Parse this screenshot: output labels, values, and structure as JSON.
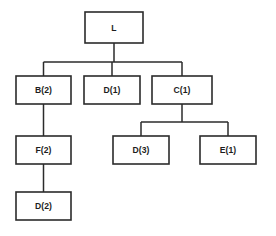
{
  "diagram": {
    "type": "tree",
    "title": "",
    "background_color": "#ffffff",
    "node_fill_color": "#ffffff",
    "node_border_color": "#2b2b2b",
    "edge_color": "#2b2b2b",
    "nodes": [
      {
        "id": "root",
        "label": "L",
        "x": 85,
        "y": 12,
        "w": 58,
        "h": 31,
        "cx": 114,
        "cy": 27.5,
        "level": 0
      },
      {
        "id": "b2",
        "label": "B(2)",
        "x": 16,
        "y": 76,
        "w": 55,
        "h": 28,
        "cx": 43.5,
        "cy": 90,
        "level": 1
      },
      {
        "id": "d1",
        "label": "D(1)",
        "x": 84,
        "y": 76,
        "w": 56,
        "h": 28,
        "cx": 112,
        "cy": 90,
        "level": 1
      },
      {
        "id": "c1",
        "label": "C(1)",
        "x": 152,
        "y": 76,
        "w": 60,
        "h": 28,
        "cx": 182,
        "cy": 90,
        "level": 1
      },
      {
        "id": "f2",
        "label": "F(2)",
        "x": 16,
        "y": 136,
        "w": 55,
        "h": 28,
        "cx": 43.5,
        "cy": 150,
        "level": 2
      },
      {
        "id": "d3",
        "label": "D(3)",
        "x": 113,
        "y": 136,
        "w": 56,
        "h": 28,
        "cx": 141,
        "cy": 150,
        "level": 2
      },
      {
        "id": "e1",
        "label": "E(1)",
        "x": 200,
        "y": 136,
        "w": 56,
        "h": 28,
        "cx": 228,
        "cy": 150,
        "level": 2
      },
      {
        "id": "d2",
        "label": "D(2)",
        "x": 16,
        "y": 192,
        "w": 55,
        "h": 28,
        "cx": 43.5,
        "cy": 206,
        "level": 3
      }
    ],
    "edges": [
      {
        "from": "root",
        "to": "b2",
        "style": "orthogonal",
        "bus_y": 62
      },
      {
        "from": "root",
        "to": "d1",
        "style": "straight",
        "bus_y": 62
      },
      {
        "from": "root",
        "to": "c1",
        "style": "orthogonal",
        "bus_y": 62
      },
      {
        "from": "b2",
        "to": "f2",
        "style": "straight",
        "bus_y": null
      },
      {
        "from": "f2",
        "to": "d2",
        "style": "straight",
        "bus_y": null
      },
      {
        "from": "c1",
        "to": "d3",
        "style": "orthogonal",
        "bus_y": 122
      },
      {
        "from": "c1",
        "to": "e1",
        "style": "orthogonal",
        "bus_y": 122
      }
    ],
    "buses": [
      {
        "id": "root-bus",
        "y": 62,
        "x1": 43.5,
        "x2": 182,
        "parent": "root"
      },
      {
        "id": "c1-bus",
        "y": 122,
        "x1": 141,
        "x2": 228,
        "parent": "c1"
      }
    ]
  }
}
